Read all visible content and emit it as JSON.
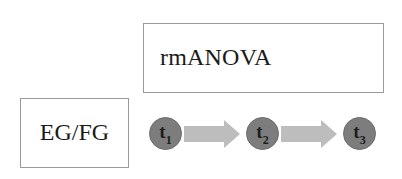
{
  "diagram": {
    "analysis_box": {
      "label": "rmANOVA"
    },
    "group_box": {
      "label": "EG/FG"
    },
    "timepoints": [
      {
        "letter": "t",
        "subscript": "1"
      },
      {
        "letter": "t",
        "subscript": "2"
      },
      {
        "letter": "t",
        "subscript": "3"
      }
    ],
    "arrows": [
      {
        "from": "t1",
        "to": "t2"
      },
      {
        "from": "t2",
        "to": "t3"
      }
    ],
    "colors": {
      "circle_fill": "#7d7d7d",
      "arrow_fill": "#bdbdbd",
      "box_border": "#9a9a9a"
    }
  }
}
